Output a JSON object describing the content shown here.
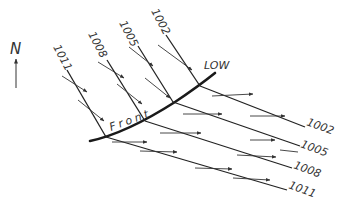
{
  "diagram": {
    "north_label": "N",
    "low_label": "LOW",
    "front_label": "Front",
    "front_letters": [
      "F",
      "r",
      "o",
      "n",
      "t"
    ],
    "isobars": [
      {
        "value": "1002",
        "top_label": "1002",
        "right_label": "1002"
      },
      {
        "value": "1005",
        "top_label": "1005",
        "right_label": "1005"
      },
      {
        "value": "1008",
        "top_label": "1008",
        "right_label": "1008"
      },
      {
        "value": "1011",
        "top_label": "1011",
        "right_label": "1011"
      }
    ]
  }
}
